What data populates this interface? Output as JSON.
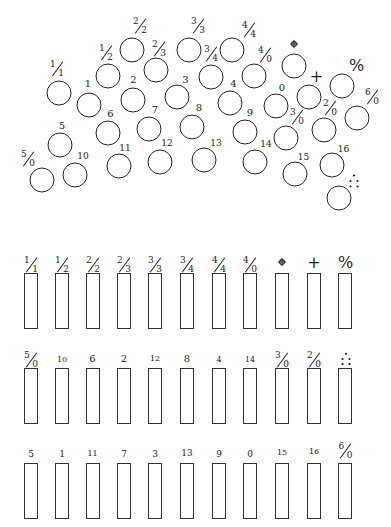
{
  "circles": [
    {
      "label": "1/1",
      "num": "1",
      "den": "1"
    },
    {
      "label": "1/2",
      "num": "1",
      "den": "2"
    },
    {
      "label": "2/2",
      "num": "2",
      "den": "2"
    },
    {
      "label": "2/3",
      "num": "2",
      "den": "3"
    },
    {
      "label": "3/3",
      "num": "3",
      "den": "3"
    },
    {
      "label": "3/4",
      "num": "3",
      "den": "4"
    },
    {
      "label": "4/4",
      "num": "4",
      "den": "4"
    },
    {
      "label": "4/0",
      "num": "4",
      "den": "0"
    },
    {
      "label": "circled-cross",
      "icon": "circled-cross-icon"
    },
    {
      "label": "+",
      "text": "+"
    },
    {
      "label": "%",
      "text": "%"
    },
    {
      "label": "6/0",
      "num": "6",
      "den": "0"
    },
    {
      "label": "1",
      "text": "1"
    },
    {
      "label": "2",
      "text": "2"
    },
    {
      "label": "3",
      "text": "3"
    },
    {
      "label": "4",
      "text": "4"
    },
    {
      "label": "0",
      "text": "0"
    },
    {
      "label": "6",
      "text": "6"
    },
    {
      "label": "7",
      "text": "7"
    },
    {
      "label": "8",
      "text": "8"
    },
    {
      "label": "9",
      "text": "9"
    },
    {
      "label": "3/0",
      "num": "3",
      "den": "0"
    },
    {
      "label": "2/0",
      "num": "2",
      "den": "0"
    },
    {
      "label": "5",
      "text": "5"
    },
    {
      "label": "5/0",
      "num": "5",
      "den": "0"
    },
    {
      "label": "10",
      "text": "10"
    },
    {
      "label": "11",
      "text": "11"
    },
    {
      "label": "12",
      "text": "12"
    },
    {
      "label": "13",
      "text": "13"
    },
    {
      "label": "14",
      "text": "14"
    },
    {
      "label": "15",
      "text": "15"
    },
    {
      "label": "16",
      "text": "16"
    },
    {
      "label": "dots",
      "icon": "five-dots-icon"
    }
  ],
  "slots": {
    "row1": [
      {
        "label": "1/1",
        "num": "1",
        "den": "1"
      },
      {
        "label": "1/2",
        "num": "1",
        "den": "2"
      },
      {
        "label": "2/2",
        "num": "2",
        "den": "2"
      },
      {
        "label": "2/3",
        "num": "2",
        "den": "3"
      },
      {
        "label": "3/3",
        "num": "3",
        "den": "3"
      },
      {
        "label": "3/4",
        "num": "3",
        "den": "4"
      },
      {
        "label": "4/4",
        "num": "4",
        "den": "4"
      },
      {
        "label": "4/0",
        "num": "4",
        "den": "0"
      },
      {
        "label": "circled-cross",
        "icon": "circled-cross-icon"
      },
      {
        "label": "+",
        "text": "+"
      },
      {
        "label": "%",
        "text": "%"
      }
    ],
    "row2": [
      {
        "label": "5/0",
        "num": "5",
        "den": "0"
      },
      {
        "label": "10",
        "text": "10"
      },
      {
        "label": "6",
        "text": "6"
      },
      {
        "label": "2",
        "text": "2"
      },
      {
        "label": "12",
        "text": "12"
      },
      {
        "label": "8",
        "text": "8"
      },
      {
        "label": "4",
        "text": "4"
      },
      {
        "label": "14",
        "text": "14"
      },
      {
        "label": "3/0",
        "num": "3",
        "den": "0"
      },
      {
        "label": "2/0",
        "num": "2",
        "den": "0"
      },
      {
        "label": "dots",
        "icon": "five-dots-icon"
      }
    ],
    "row3": [
      {
        "label": "5",
        "text": "5"
      },
      {
        "label": "1",
        "text": "1"
      },
      {
        "label": "11",
        "text": "11"
      },
      {
        "label": "7",
        "text": "7"
      },
      {
        "label": "3",
        "text": "3"
      },
      {
        "label": "13",
        "text": "13"
      },
      {
        "label": "9",
        "text": "9"
      },
      {
        "label": "0",
        "text": "0"
      },
      {
        "label": "15",
        "text": "15"
      },
      {
        "label": "16",
        "text": "16"
      },
      {
        "label": "6/0",
        "num": "6",
        "den": "0"
      }
    ]
  },
  "colors": {
    "stroke": "#222222",
    "background": "#ffffff"
  }
}
